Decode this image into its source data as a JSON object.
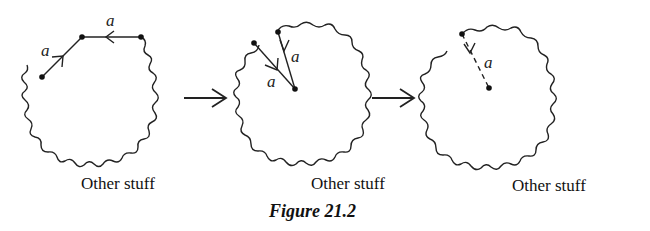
{
  "figure": {
    "caption": "Figure 21.2",
    "panels": [
      {
        "label": "Other stuff",
        "edge_labels": [
          "a",
          "a"
        ]
      },
      {
        "label": "Other stuff",
        "edge_labels": [
          "a",
          "a"
        ]
      },
      {
        "label": "Other stuff",
        "edge_labels": [
          "a"
        ]
      }
    ]
  }
}
